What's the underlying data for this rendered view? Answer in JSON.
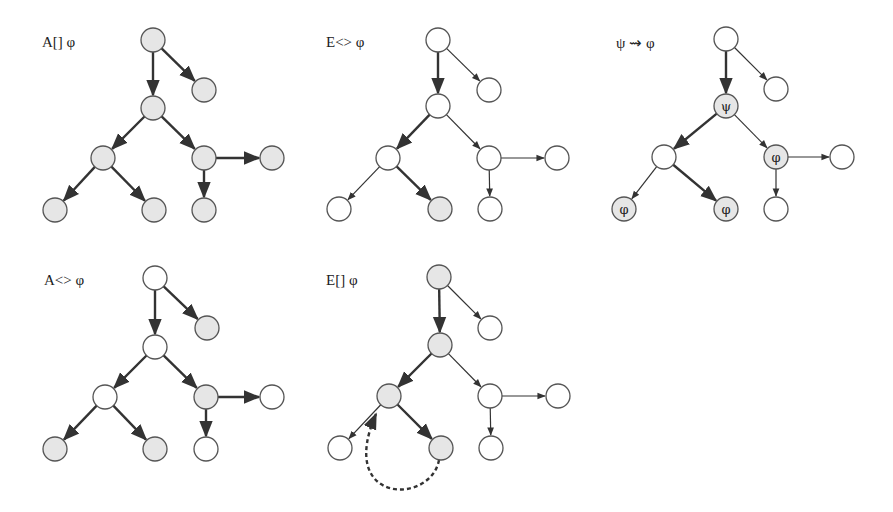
{
  "panels": [
    {
      "id": "AG",
      "label": "A[]  φ",
      "label_pos": [
        42,
        48
      ],
      "nodes": [
        {
          "x": 153,
          "y": 40,
          "fill": true
        },
        {
          "x": 204,
          "y": 90,
          "fill": true
        },
        {
          "x": 153,
          "y": 108,
          "fill": true
        },
        {
          "x": 103,
          "y": 158,
          "fill": true
        },
        {
          "x": 204,
          "y": 158,
          "fill": true
        },
        {
          "x": 272,
          "y": 158,
          "fill": true
        },
        {
          "x": 55,
          "y": 210,
          "fill": true
        },
        {
          "x": 154,
          "y": 210,
          "fill": true
        },
        {
          "x": 204,
          "y": 210,
          "fill": true
        }
      ],
      "edges": [
        [
          0,
          1,
          true
        ],
        [
          0,
          2,
          true
        ],
        [
          2,
          3,
          true
        ],
        [
          2,
          4,
          true
        ],
        [
          4,
          5,
          true
        ],
        [
          3,
          6,
          true
        ],
        [
          3,
          7,
          true
        ],
        [
          4,
          8,
          true
        ]
      ]
    },
    {
      "id": "EF",
      "label": "E<>  φ",
      "label_pos": [
        326,
        48
      ],
      "nodes": [
        {
          "x": 438,
          "y": 40,
          "fill": false
        },
        {
          "x": 489,
          "y": 90,
          "fill": false
        },
        {
          "x": 438,
          "y": 106,
          "fill": false
        },
        {
          "x": 388,
          "y": 158,
          "fill": false
        },
        {
          "x": 489,
          "y": 158,
          "fill": false
        },
        {
          "x": 557,
          "y": 158,
          "fill": false
        },
        {
          "x": 339,
          "y": 209,
          "fill": false
        },
        {
          "x": 440,
          "y": 209,
          "fill": true
        },
        {
          "x": 490,
          "y": 209,
          "fill": false
        }
      ],
      "edges": [
        [
          0,
          1,
          false
        ],
        [
          0,
          2,
          true
        ],
        [
          2,
          3,
          true
        ],
        [
          2,
          4,
          false
        ],
        [
          4,
          5,
          false
        ],
        [
          3,
          6,
          false
        ],
        [
          3,
          7,
          true
        ],
        [
          4,
          8,
          false
        ]
      ]
    },
    {
      "id": "LeadsTo",
      "label": "ψ  ⇝ φ",
      "label_pos": [
        616,
        48
      ],
      "nodes": [
        {
          "x": 726,
          "y": 39,
          "fill": false
        },
        {
          "x": 776,
          "y": 89,
          "fill": false
        },
        {
          "x": 726,
          "y": 106,
          "fill": true,
          "text": "ψ"
        },
        {
          "x": 664,
          "y": 157,
          "fill": false
        },
        {
          "x": 776,
          "y": 157,
          "fill": true,
          "text": "φ"
        },
        {
          "x": 842,
          "y": 157,
          "fill": false
        },
        {
          "x": 624,
          "y": 209,
          "fill": true,
          "text": "φ"
        },
        {
          "x": 726,
          "y": 209,
          "fill": true,
          "text": "φ"
        },
        {
          "x": 776,
          "y": 209,
          "fill": false
        }
      ],
      "edges": [
        [
          0,
          1,
          false
        ],
        [
          0,
          2,
          true
        ],
        [
          2,
          3,
          true
        ],
        [
          2,
          4,
          false
        ],
        [
          4,
          5,
          false
        ],
        [
          3,
          6,
          false
        ],
        [
          3,
          7,
          true
        ],
        [
          4,
          8,
          false
        ]
      ]
    },
    {
      "id": "AF",
      "label": "A<>  φ",
      "label_pos": [
        44,
        286
      ],
      "nodes": [
        {
          "x": 155,
          "y": 278,
          "fill": false
        },
        {
          "x": 207,
          "y": 328,
          "fill": true
        },
        {
          "x": 155,
          "y": 347,
          "fill": false
        },
        {
          "x": 105,
          "y": 397,
          "fill": false
        },
        {
          "x": 206,
          "y": 397,
          "fill": true
        },
        {
          "x": 272,
          "y": 397,
          "fill": false
        },
        {
          "x": 55,
          "y": 449,
          "fill": true
        },
        {
          "x": 155,
          "y": 449,
          "fill": true
        },
        {
          "x": 206,
          "y": 449,
          "fill": false
        }
      ],
      "edges": [
        [
          0,
          1,
          true
        ],
        [
          0,
          2,
          true
        ],
        [
          2,
          3,
          true
        ],
        [
          2,
          4,
          true
        ],
        [
          4,
          5,
          true
        ],
        [
          3,
          6,
          true
        ],
        [
          3,
          7,
          true
        ],
        [
          4,
          8,
          true
        ]
      ]
    },
    {
      "id": "EG",
      "label": "E[]  φ",
      "label_pos": [
        326,
        286
      ],
      "nodes": [
        {
          "x": 439,
          "y": 277,
          "fill": true
        },
        {
          "x": 490,
          "y": 328,
          "fill": false
        },
        {
          "x": 440,
          "y": 345,
          "fill": true
        },
        {
          "x": 389,
          "y": 396,
          "fill": true
        },
        {
          "x": 490,
          "y": 396,
          "fill": false
        },
        {
          "x": 558,
          "y": 396,
          "fill": false
        },
        {
          "x": 340,
          "y": 448,
          "fill": false
        },
        {
          "x": 441,
          "y": 448,
          "fill": true
        },
        {
          "x": 491,
          "y": 448,
          "fill": false
        }
      ],
      "edges": [
        [
          0,
          1,
          false
        ],
        [
          0,
          2,
          true
        ],
        [
          2,
          3,
          true
        ],
        [
          2,
          4,
          false
        ],
        [
          4,
          5,
          false
        ],
        [
          3,
          6,
          false
        ],
        [
          3,
          7,
          true
        ],
        [
          4,
          8,
          false
        ]
      ],
      "loop": {
        "from": 7,
        "to": 3,
        "dashed": true
      }
    }
  ],
  "colors": {
    "fill": "#e6e6e6",
    "stroke": "#555555",
    "empty": "#ffffff",
    "edge": "#333333"
  },
  "node_radius": 12
}
